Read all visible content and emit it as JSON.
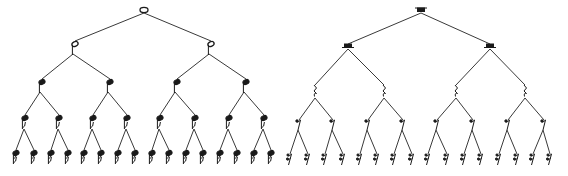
{
  "diagram": {
    "ink_color": "#1a1a1a",
    "edge_color": "#3a3a3a",
    "background": "#ffffff"
  },
  "trees": [
    {
      "name": "note-values",
      "kind": "notes",
      "levels": [
        {
          "symbol": "whole-note",
          "y": 10,
          "x": [
            144
          ]
        },
        {
          "symbol": "half-note",
          "y": 44,
          "x": [
            75,
            211
          ]
        },
        {
          "symbol": "quarter-note",
          "y": 82,
          "x": [
            42,
            110,
            177,
            246
          ]
        },
        {
          "symbol": "eighth-note",
          "y": 118,
          "x": [
            25,
            59,
            93,
            127,
            160,
            195,
            229,
            264
          ]
        },
        {
          "symbol": "sixteenth-note",
          "y": 153,
          "x": [
            16,
            34,
            51,
            68,
            84,
            101,
            118,
            135,
            152,
            169,
            186,
            203,
            220,
            237,
            254,
            271
          ]
        }
      ]
    },
    {
      "name": "rest-values",
      "kind": "rests",
      "levels": [
        {
          "symbol": "whole-rest",
          "y": 10,
          "x": [
            421
          ]
        },
        {
          "symbol": "half-rest",
          "y": 47,
          "x": [
            348,
            490
          ]
        },
        {
          "symbol": "quarter-rest",
          "y": 92,
          "x": [
            315,
            384,
            456,
            525
          ]
        },
        {
          "symbol": "eighth-rest",
          "y": 123,
          "x": [
            299,
            333,
            368,
            403,
            437,
            473,
            508,
            544
          ]
        },
        {
          "symbol": "sixteenth-rest",
          "y": 158,
          "x": [
            290,
            308,
            325,
            343,
            360,
            377,
            394,
            412,
            428,
            447,
            464,
            481,
            499,
            517,
            533,
            550
          ]
        }
      ]
    }
  ]
}
